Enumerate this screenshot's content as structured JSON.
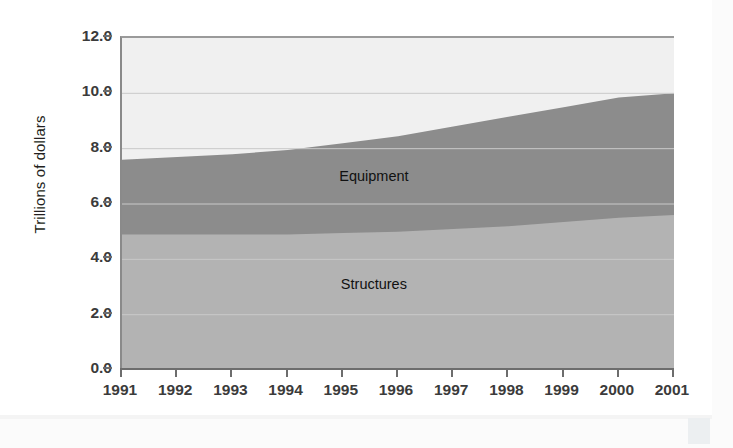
{
  "chart_data": {
    "type": "area",
    "title": "",
    "subtitle": "",
    "xlabel": "",
    "ylabel": "Trillions of dollars",
    "categories": [
      "1991",
      "1992",
      "1993",
      "1994",
      "1995",
      "1996",
      "1997",
      "1998",
      "1999",
      "2000",
      "2001"
    ],
    "x": [
      1991,
      1992,
      1993,
      1994,
      1995,
      1996,
      1997,
      1998,
      1999,
      2000,
      2001
    ],
    "stacked": true,
    "series": [
      {
        "name": "Structures",
        "color": "#b3b3b3",
        "values": [
          4.9,
          4.9,
          4.9,
          4.9,
          4.95,
          5.0,
          5.1,
          5.2,
          5.35,
          5.5,
          5.6
        ]
      },
      {
        "name": "Equipment",
        "color": "#8c8c8c",
        "values": [
          2.7,
          2.8,
          2.9,
          3.05,
          3.25,
          3.45,
          3.7,
          3.95,
          4.15,
          4.35,
          4.4
        ]
      }
    ],
    "cumulative_top": [
      7.6,
      7.7,
      7.8,
      7.95,
      8.2,
      8.45,
      8.8,
      9.15,
      9.5,
      9.85,
      10.0
    ],
    "ylim": [
      0.0,
      12.0
    ],
    "yticks": [
      "0.0",
      "2.0",
      "4.0",
      "6.0",
      "8.0",
      "10.0",
      "12.0"
    ],
    "ytick_values": [
      0.0,
      2.0,
      4.0,
      6.0,
      8.0,
      10.0,
      12.0
    ],
    "xlim": [
      1991,
      2001
    ],
    "grid": true,
    "grid_color": "#c9c9c9",
    "plot_background": "#f0f0f0",
    "legend": "inline-labels",
    "labels": [
      {
        "text": "Equipment",
        "x": 1995.6,
        "y": 6.95
      },
      {
        "text": "Structures",
        "x": 1995.6,
        "y": 3.05
      }
    ]
  }
}
